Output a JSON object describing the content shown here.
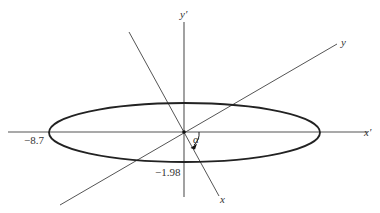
{
  "diagram": {
    "type": "rotated-axes-ellipse",
    "colors": {
      "background": "#ffffff",
      "axis": "#555555",
      "ellipse": "#222222",
      "text": "#333333"
    },
    "origin": {
      "x": 184,
      "y": 132
    },
    "ellipse": {
      "cx": 184.5,
      "cy": 132.5,
      "rx": 135.5,
      "ry": 29.5
    },
    "axes": {
      "x_prime": {
        "label": "x′",
        "x1": 8,
        "y1": 132,
        "x2": 368,
        "y2": 132,
        "label_x": 364,
        "label_y": 136
      },
      "y_prime": {
        "label": "y′",
        "x1": 184,
        "y1": 22,
        "x2": 184,
        "y2": 197,
        "label_x": 180,
        "label_y": 18
      },
      "x_rotated": {
        "label": "x",
        "x1": 129,
        "y1": 32,
        "x2": 219,
        "y2": 196,
        "label_x": 220,
        "label_y": 203
      },
      "y_rotated": {
        "label": "y",
        "x1": 60,
        "y1": 205,
        "x2": 337,
        "y2": 44,
        "label_x": 341,
        "label_y": 46
      }
    },
    "annotations": {
      "semi_major_label": "−8.7",
      "semi_minor_label": "−1.98",
      "angle_label": "α"
    }
  }
}
